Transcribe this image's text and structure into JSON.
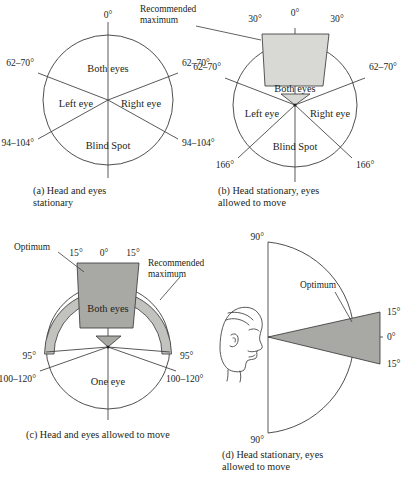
{
  "figure": {
    "background_color": "#ffffff",
    "ink_color": "#231f20",
    "shade_light": "#d8d8d4",
    "shade_mid": "#a8a8a4",
    "shade_band": "#c2c2be"
  },
  "panels": [
    {
      "id": "a",
      "caption_line1": "(a) Head and eyes",
      "caption_line2": "stationary",
      "regions": {
        "top": "Both eyes",
        "left": "Left eye",
        "right": "Right eye",
        "bottom": "Blind Spot"
      },
      "angles": {
        "top_center": "0°",
        "upper_left": "62–70°",
        "upper_right": "62–70°",
        "lower_left": "94–104°",
        "lower_right": "94–104°"
      }
    },
    {
      "id": "b",
      "caption_line1": "(b) Head stationary, eyes",
      "caption_line2": "allowed to move",
      "regions": {
        "top": "Both eyes",
        "left": "Left eye",
        "right": "Right eye",
        "bottom": "Blind Spot"
      },
      "angles": {
        "top_center": "0°",
        "wedge_left": "30°",
        "wedge_right": "30°",
        "upper_left": "62–70°",
        "upper_right": "62–70°",
        "lower_left": "166°",
        "lower_right": "166°"
      },
      "annotations": {
        "recommended_line1": "Recommended",
        "recommended_line2": "maximum"
      }
    },
    {
      "id": "c",
      "caption_line1": "(c) Head and eyes allowed to move",
      "caption_line2": "",
      "regions": {
        "top": "Both eyes",
        "bottom": "One eye"
      },
      "angles": {
        "top_center": "0°",
        "wedge_left": "15°",
        "wedge_right": "15°",
        "band_left": "95°",
        "band_right": "95°",
        "lower_left": "100–120°",
        "lower_right": "100–120°"
      },
      "annotations": {
        "optimum": "Optimum",
        "recommended_line1": "Recommended",
        "recommended_line2": "maximum"
      }
    },
    {
      "id": "d",
      "caption_line1": "(d) Head stationary, eyes",
      "caption_line2": "allowed to move",
      "angles": {
        "top": "90°",
        "bottom": "90°",
        "upper": "15°",
        "center": "0°",
        "lower": "15°"
      },
      "annotations": {
        "optimum": "Optimum"
      },
      "icon": "head-profile-icon"
    }
  ]
}
